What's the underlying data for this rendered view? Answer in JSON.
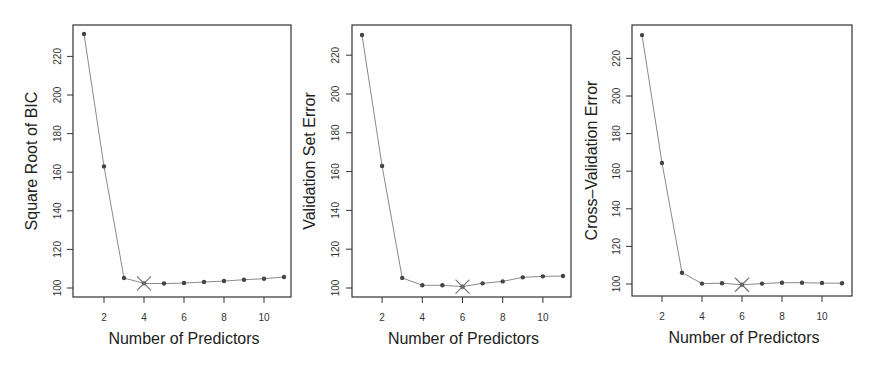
{
  "figure": {
    "panels": [
      {
        "id": "bic",
        "ylabel": "Square Root of BIC",
        "xlabel": "Number of Predictors"
      },
      {
        "id": "validation",
        "ylabel": "Validation Set Error",
        "xlabel": "Number of Predictors"
      },
      {
        "id": "cv",
        "ylabel": "Cross–Validation Error",
        "xlabel": "Number of Predictors"
      }
    ]
  },
  "chart_data": [
    {
      "type": "line",
      "title": "",
      "xlabel": "Number of Predictors",
      "ylabel": "Square Root of BIC",
      "x": [
        1,
        2,
        3,
        4,
        5,
        6,
        7,
        8,
        9,
        10,
        11
      ],
      "values": [
        231.6,
        163.0,
        105.2,
        102.4,
        102.3,
        102.6,
        103.1,
        103.6,
        104.3,
        104.8,
        105.7
      ],
      "marked_min": {
        "x": 4,
        "y": 102.4,
        "marker": "X"
      },
      "xticks": [
        2,
        4,
        6,
        8,
        10
      ],
      "yticks": [
        100,
        120,
        140,
        160,
        180,
        200,
        220
      ],
      "xlim": [
        0.6,
        11.4
      ],
      "ylim": [
        95,
        236
      ],
      "grid": false,
      "legend": null
    },
    {
      "type": "line",
      "title": "",
      "xlabel": "Number of Predictors",
      "ylabel": "Validation Set Error",
      "x": [
        1,
        2,
        3,
        4,
        5,
        6,
        7,
        8,
        9,
        10,
        11
      ],
      "values": [
        230.4,
        162.9,
        105.2,
        101.4,
        101.4,
        100.7,
        102.4,
        103.4,
        105.5,
        106.0,
        106.2
      ],
      "marked_min": {
        "x": 6,
        "y": 100.7,
        "marker": "X"
      },
      "xticks": [
        2,
        4,
        6,
        8,
        10
      ],
      "yticks": [
        100,
        120,
        140,
        160,
        180,
        200,
        220
      ],
      "xlim": [
        0.6,
        11.4
      ],
      "ylim": [
        95,
        236
      ],
      "grid": false,
      "legend": null
    },
    {
      "type": "line",
      "title": "",
      "xlabel": "Number of Predictors",
      "ylabel": "Cross–Validation Error",
      "x": [
        1,
        2,
        3,
        4,
        5,
        6,
        7,
        8,
        9,
        10,
        11
      ],
      "values": [
        232.4,
        164.4,
        106.0,
        100.2,
        100.4,
        99.6,
        100.2,
        100.7,
        100.7,
        100.5,
        100.4
      ],
      "marked_min": {
        "x": 6,
        "y": 99.6,
        "marker": "X"
      },
      "xticks": [
        2,
        4,
        6,
        8,
        10
      ],
      "yticks": [
        100,
        120,
        140,
        160,
        180,
        200,
        220
      ],
      "xlim": [
        0.6,
        11.4
      ],
      "ylim": [
        95,
        238
      ],
      "grid": false,
      "legend": null
    }
  ]
}
